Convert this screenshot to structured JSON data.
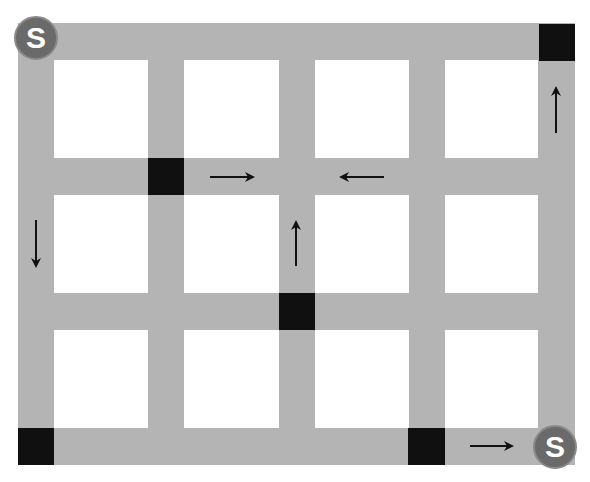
{
  "diagram": {
    "type": "street-grid",
    "colors": {
      "road": "#b4b4b4",
      "block": "#ffffff",
      "hub": "#101010",
      "start_fill": "#6a6a6a",
      "start_text": "#ffffff",
      "arrow": "#111111"
    },
    "roads": {
      "vertical": [
        {
          "x": 18,
          "w": 36
        },
        {
          "x": 148,
          "w": 36
        },
        {
          "x": 279,
          "w": 36
        },
        {
          "x": 409,
          "w": 36
        },
        {
          "x": 538,
          "w": 37
        }
      ],
      "horizontal": [
        {
          "y": 23,
          "h": 37
        },
        {
          "y": 158,
          "h": 37
        },
        {
          "y": 293,
          "h": 37
        },
        {
          "y": 428,
          "h": 37
        }
      ],
      "extent": {
        "left": 18,
        "top": 23,
        "right": 575,
        "bottom": 465
      }
    },
    "hubs": [
      {
        "x": 539,
        "y": 24,
        "w": 36,
        "h": 37
      },
      {
        "x": 148,
        "y": 158,
        "w": 36,
        "h": 37
      },
      {
        "x": 279,
        "y": 293,
        "w": 36,
        "h": 37
      },
      {
        "x": 18,
        "y": 428,
        "w": 36,
        "h": 37
      },
      {
        "x": 408,
        "y": 428,
        "w": 37,
        "h": 37
      }
    ],
    "arrows": [
      {
        "direction": "up",
        "x1": 556,
        "y1": 133,
        "x2": 556,
        "y2": 88
      },
      {
        "direction": "right",
        "x1": 210,
        "y1": 177,
        "x2": 253,
        "y2": 177
      },
      {
        "direction": "left",
        "x1": 384,
        "y1": 177,
        "x2": 341,
        "y2": 177
      },
      {
        "direction": "down",
        "x1": 36,
        "y1": 220,
        "x2": 36,
        "y2": 266
      },
      {
        "direction": "up",
        "x1": 296,
        "y1": 266,
        "x2": 296,
        "y2": 222
      },
      {
        "direction": "right",
        "x1": 470,
        "y1": 446,
        "x2": 512,
        "y2": 446
      }
    ],
    "start_markers": [
      {
        "label": "S",
        "cx": 36,
        "cy": 38
      },
      {
        "label": "S",
        "cx": 555,
        "cy": 447
      }
    ]
  }
}
